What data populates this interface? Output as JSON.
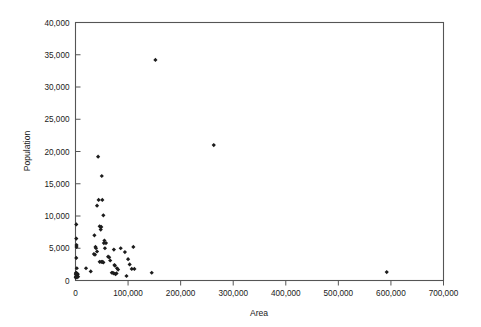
{
  "chart_data": {
    "type": "scatter",
    "title": "",
    "xlabel": "Area",
    "ylabel": "Population",
    "xlim": [
      0,
      700000
    ],
    "ylim": [
      0,
      40000
    ],
    "grid": false,
    "legend": null,
    "marker_symbol": "diamond",
    "marker_color": "#1c1c1c",
    "xticks": [
      0,
      100000,
      200000,
      300000,
      400000,
      500000,
      600000,
      700000
    ],
    "xticklabels": [
      "0",
      "100,000",
      "200,000",
      "300,000",
      "400,000",
      "500,000",
      "600,000",
      "700,000"
    ],
    "yticks": [
      0,
      5000,
      10000,
      15000,
      20000,
      25000,
      30000,
      35000,
      40000
    ],
    "yticklabels": [
      "0",
      "5,000",
      "10,000",
      "15,000",
      "20,000",
      "25,000",
      "30,000",
      "35,000",
      "40,000"
    ],
    "points": [
      [
        152000,
        34200
      ],
      [
        263000,
        21000
      ],
      [
        43000,
        19200
      ],
      [
        50000,
        16200
      ],
      [
        44000,
        12500
      ],
      [
        51000,
        12500
      ],
      [
        41000,
        11600
      ],
      [
        53000,
        10100
      ],
      [
        1500,
        8700
      ],
      [
        46000,
        8400
      ],
      [
        49000,
        8300
      ],
      [
        48000,
        7900
      ],
      [
        36000,
        7000
      ],
      [
        1500,
        6500
      ],
      [
        55000,
        6200
      ],
      [
        54000,
        5800
      ],
      [
        58000,
        5800
      ],
      [
        2000,
        5500
      ],
      [
        2000,
        5200
      ],
      [
        38000,
        5200
      ],
      [
        39000,
        5000
      ],
      [
        56000,
        5000
      ],
      [
        110000,
        5200
      ],
      [
        86000,
        5000
      ],
      [
        73000,
        4800
      ],
      [
        41000,
        4500
      ],
      [
        94000,
        4400
      ],
      [
        35000,
        4100
      ],
      [
        37000,
        4000
      ],
      [
        1500,
        3500
      ],
      [
        62000,
        3700
      ],
      [
        64000,
        3600
      ],
      [
        100000,
        3300
      ],
      [
        66000,
        3100
      ],
      [
        46000,
        2900
      ],
      [
        49000,
        2900
      ],
      [
        51000,
        2900
      ],
      [
        53000,
        2800
      ],
      [
        103000,
        2500
      ],
      [
        74000,
        2400
      ],
      [
        75000,
        2300
      ],
      [
        2500,
        1900
      ],
      [
        20000,
        1900
      ],
      [
        79000,
        1900
      ],
      [
        81000,
        1700
      ],
      [
        107000,
        1800
      ],
      [
        112000,
        1800
      ],
      [
        29000,
        1400
      ],
      [
        69000,
        1200
      ],
      [
        71000,
        1200
      ],
      [
        73000,
        1100
      ],
      [
        76000,
        1000
      ],
      [
        78000,
        1100
      ],
      [
        145000,
        1200
      ],
      [
        592000,
        1300
      ],
      [
        97000,
        700
      ],
      [
        1000,
        1200
      ],
      [
        1500,
        1100
      ],
      [
        2500,
        1100
      ],
      [
        3500,
        1050
      ],
      [
        1200,
        900
      ],
      [
        2200,
        800
      ],
      [
        3000,
        750
      ],
      [
        800,
        600
      ],
      [
        1800,
        550
      ],
      [
        2800,
        500
      ],
      [
        4200,
        950
      ],
      [
        600,
        1000
      ],
      [
        5000,
        600
      ],
      [
        400,
        450
      ]
    ]
  }
}
